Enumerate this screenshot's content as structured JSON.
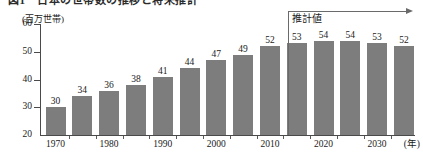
{
  "chart_data": {
    "type": "bar",
    "title": "図1　日本の世帯数の推移と将来推計",
    "unit_label": "(百万世帯)",
    "xlabel": "(年)",
    "ylabel": "",
    "categories": [
      "1970",
      "1975",
      "1980",
      "1985",
      "1990",
      "1995",
      "2000",
      "2005",
      "2010",
      "2015",
      "2020",
      "2025",
      "2030",
      "2035"
    ],
    "values": [
      30,
      34,
      36,
      38,
      41,
      44,
      47,
      49,
      52,
      53,
      54,
      54,
      53,
      52
    ],
    "x_tick_labels": [
      "1970",
      "1980",
      "1990",
      "2000",
      "2010",
      "2020",
      "2030"
    ],
    "y_ticks": [
      20,
      30,
      40,
      50,
      60
    ],
    "ylim": [
      20,
      60
    ],
    "grid": false,
    "legend": "none",
    "bar_color": "#7d7d7d",
    "axis_color": "#4a4a4a",
    "annotations": [
      {
        "name": "forecast-region",
        "text": "推計値",
        "starts_at_category": "2020",
        "direction": "right"
      }
    ]
  }
}
